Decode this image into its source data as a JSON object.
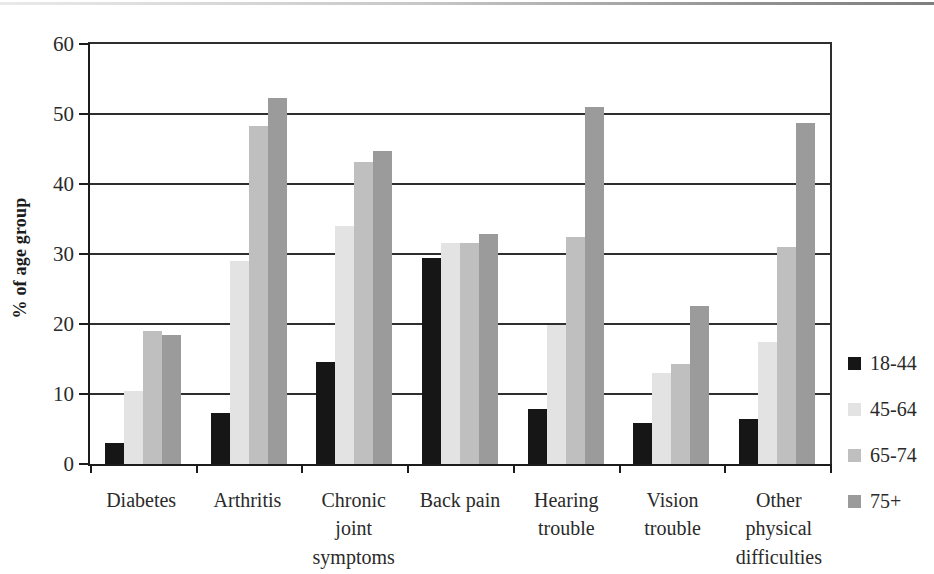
{
  "chart_data": {
    "type": "bar",
    "title": "",
    "xlabel": "",
    "ylabel": "% of age group",
    "ylim": [
      0,
      60
    ],
    "yticks": [
      0,
      10,
      20,
      30,
      40,
      50,
      60
    ],
    "grid": true,
    "legend_position": "right",
    "categories": [
      "Diabetes",
      "Arthritis",
      "Chronic\njoint\nsymptoms",
      "Back pain",
      "Hearing\ntrouble",
      "Vision\ntrouble",
      "Other\nphysical\ndifficulties"
    ],
    "series": [
      {
        "name": "18-44",
        "color": "#161616",
        "values": [
          3.0,
          7.3,
          14.6,
          29.4,
          7.8,
          5.8,
          6.4
        ]
      },
      {
        "name": "45-64",
        "color": "#e3e3e3",
        "values": [
          10.5,
          29.0,
          34.0,
          31.6,
          19.8,
          13.0,
          17.5
        ]
      },
      {
        "name": "65-74",
        "color": "#bfbfbf",
        "values": [
          19.0,
          48.3,
          43.2,
          31.6,
          32.5,
          14.3,
          31.0
        ]
      },
      {
        "name": "75+",
        "color": "#9b9b9b",
        "values": [
          18.5,
          52.3,
          44.7,
          32.8,
          51.0,
          22.6,
          48.7
        ]
      }
    ]
  }
}
